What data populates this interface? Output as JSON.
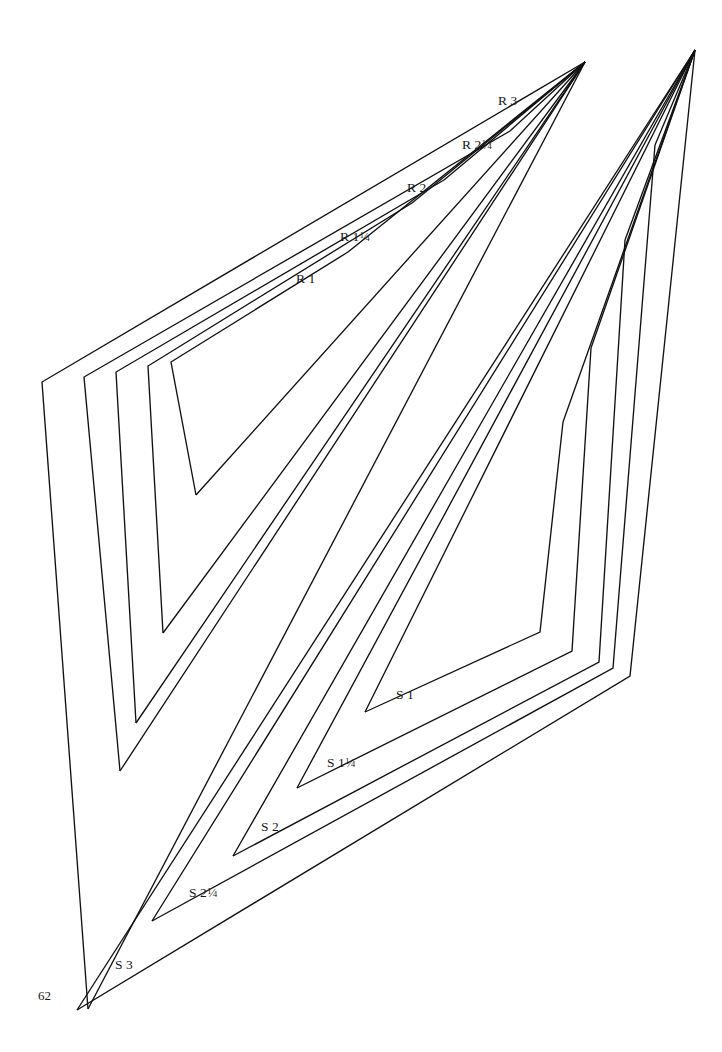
{
  "page": {
    "number": "62",
    "background_color": "#ffffff",
    "ink_color": "#111111",
    "width": 722,
    "height": 1052
  },
  "figure": {
    "type": "nested-chevron-template-plate",
    "stroke_color": "#111111",
    "stroke_width": 1.35,
    "fill": "none"
  },
  "groups": [
    {
      "id": "R",
      "name": "R series",
      "orientation": "upper-left",
      "apex": {
        "x": 585,
        "y": 62
      },
      "shapes": [
        {
          "label_prefix": "R",
          "size": "1",
          "label_text": "R 1",
          "label": {
            "x": 296,
            "y": 272
          },
          "points": "348,252 171,362 196,495"
        },
        {
          "label_prefix": "R",
          "size": "1¼",
          "label_text": "R 1¼",
          "label": {
            "x": 340,
            "y": 230
          },
          "points": "412,203 148,366 163,633"
        },
        {
          "label_prefix": "R",
          "size": "2",
          "label_text": "R 2",
          "label": {
            "x": 407,
            "y": 181
          },
          "points": "444,180 116,372 136,723"
        },
        {
          "label_prefix": "R",
          "size": "2¼",
          "label_text": "R 2¼",
          "label": {
            "x": 462,
            "y": 138
          },
          "points": "510,131 84,377 120,771"
        },
        {
          "label_prefix": "R",
          "size": "3",
          "label_text": "R 3",
          "label": {
            "x": 498,
            "y": 94
          },
          "points": "585,62 42,382 88,1009"
        }
      ]
    },
    {
      "id": "S",
      "name": "S series",
      "orientation": "lower-right",
      "apex": {
        "x": 695,
        "y": 50
      },
      "shapes": [
        {
          "label_prefix": "S",
          "size": "1",
          "label_text": "S 1",
          "label": {
            "x": 396,
            "y": 688
          },
          "points": "563,422 540,632 365,712"
        },
        {
          "label_prefix": "S",
          "size": "1¼",
          "label_text": "S 1¼",
          "label": {
            "x": 327,
            "y": 756
          },
          "points": "591,348 572,651 297,788"
        },
        {
          "label_prefix": "S",
          "size": "2",
          "label_text": "S 2",
          "label": {
            "x": 261,
            "y": 820
          },
          "points": "625,240 599,662 233,856"
        },
        {
          "label_prefix": "S",
          "size": "2¼",
          "label_text": "S 2¼",
          "label": {
            "x": 189,
            "y": 886
          },
          "points": "655,145 613,668 152,921"
        },
        {
          "label_prefix": "S",
          "size": "3",
          "label_text": "S 3",
          "label": {
            "x": 115,
            "y": 958
          },
          "points": "695,50 630,676 77,1010"
        }
      ]
    }
  ]
}
